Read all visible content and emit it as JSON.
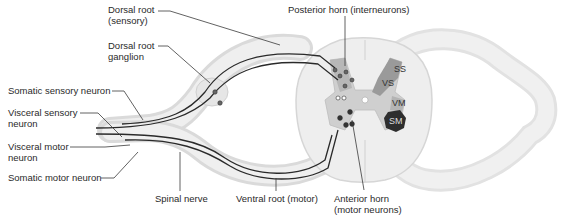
{
  "diagram": {
    "labels": {
      "dorsal_root": [
        "Dorsal root",
        "(sensory)"
      ],
      "dorsal_root_ganglion": [
        "Dorsal root",
        "ganglion"
      ],
      "posterior_horn": "Posterior horn (interneurons)",
      "somatic_sensory_neuron": "Somatic sensory neuron",
      "visceral_sensory_neuron": [
        "Visceral sensory",
        "neuron"
      ],
      "visceral_motor_neuron": [
        "Visceral motor",
        "neuron"
      ],
      "somatic_motor_neuron": "Somatic motor neuron",
      "spinal_nerve": "Spinal nerve",
      "ventral_root": "Ventral root (motor)",
      "anterior_horn": [
        "Anterior horn",
        "(motor neurons)"
      ]
    },
    "zones": {
      "ss": "SS",
      "vs": "VS",
      "vm": "VM",
      "sm": "SM"
    },
    "colors": {
      "nerve_fill": "#ececec",
      "nerve_edge": "#d4d4d4",
      "cord_fill": "#eeeeee",
      "gray_matter": "#c8c8c8",
      "ss_vs_zone": "#9a9a9a",
      "sm_zone": "#2e2e2e",
      "axon": "#2a2a2a",
      "leader": "#3a3a3a"
    }
  }
}
